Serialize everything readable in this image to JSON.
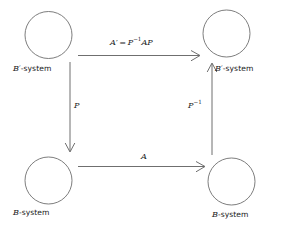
{
  "diagram": {
    "type": "commutative-square",
    "stroke_color": "#5f6e6e",
    "background_color": "#ffffff",
    "text_color": "#1a1a1a",
    "nodes": [
      {
        "id": "top-left",
        "label_var": "B",
        "label_prime": "′",
        "label_suffix": "-system",
        "label_full": "B′-system",
        "cx": 48.5,
        "cy": 35,
        "r": 23.5
      },
      {
        "id": "top-right",
        "label_var": "B",
        "label_prime": "′",
        "label_suffix": "-system",
        "label_full": "B′-system",
        "cx": 226.5,
        "cy": 33.5,
        "r": 23.5
      },
      {
        "id": "bottom-left",
        "label_var": "B",
        "label_prime": "",
        "label_suffix": "-system",
        "label_full": "B-system",
        "cx": 48.5,
        "cy": 180.5,
        "r": 23.5
      },
      {
        "id": "bottom-right",
        "label_var": "B",
        "label_prime": "",
        "label_suffix": "-system",
        "label_full": "B-system",
        "cx": 231.5,
        "cy": 181.5,
        "r": 23.5
      }
    ],
    "edges": [
      {
        "id": "edge-top",
        "from": "top-left",
        "to": "top-right",
        "direction": "right",
        "label_full": "A′ = P⁻¹AP",
        "label_lhs": "A",
        "label_prime": "′",
        "label_eq": "=",
        "label_rhs_base": "P",
        "label_rhs_exp": "−1",
        "label_rhs_tail": "AP"
      },
      {
        "id": "edge-bottom",
        "from": "bottom-left",
        "to": "bottom-right",
        "direction": "right",
        "label_full": "A"
      },
      {
        "id": "edge-left",
        "from": "top-left",
        "to": "bottom-left",
        "direction": "down",
        "label_full": "P"
      },
      {
        "id": "edge-right",
        "from": "bottom-right",
        "to": "top-right",
        "direction": "up",
        "label_full": "P⁻¹",
        "label_base": "P",
        "label_exp": "−1"
      }
    ]
  }
}
